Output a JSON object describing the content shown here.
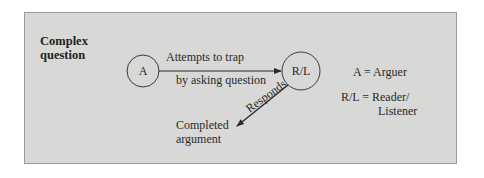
{
  "diagram": {
    "title_line1": "Complex",
    "title_line2": "question",
    "nodes": {
      "arguer": {
        "label": "A"
      },
      "reader_listener": {
        "label": "R/L"
      }
    },
    "edges": {
      "trap": {
        "label_line1": "Attempts to trap",
        "label_line2": "by asking question"
      },
      "responds": {
        "label": "Responds"
      }
    },
    "outcome": {
      "line1": "Completed",
      "line2": "argument"
    },
    "legend": {
      "a": "A = Arguer",
      "rl_line1": "R/L = Reader/",
      "rl_line2": "Listener"
    },
    "colors": {
      "panel_bg": "#d8d8d6",
      "panel_border": "#9a9a98",
      "stroke": "#2a2a2a"
    }
  }
}
